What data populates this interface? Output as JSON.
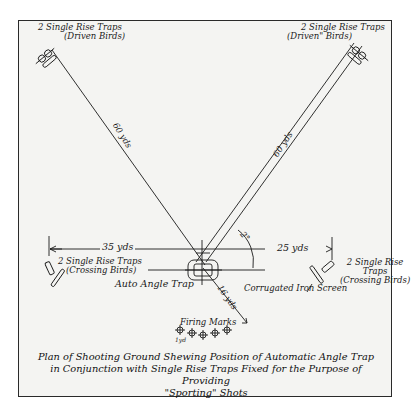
{
  "diagram": {
    "title": "Plan of Shooting Ground Shewing Position of Automatic Angle Trap in Conjunction with Single Rise Traps Fixed for the Purpose of Providing \"Sporting\" Shots",
    "caption_lines": [
      "Plan of Shooting Ground Shewing Position of Automatic Angle Trap",
      "in Conjunction with Single Rise Traps Fixed for the Purpose of Providing",
      "\"Sporting\" Shots"
    ],
    "traps": {
      "top_left": {
        "line1": "2 Single Rise Traps",
        "line2": "(Driven Birds)"
      },
      "top_right": {
        "line1": "2 Single Rise Traps",
        "line2": "(Driven\" Birds)"
      },
      "left": {
        "line1": "2 Single Rise Traps",
        "line2": "(Crossing Birds)"
      },
      "right": {
        "line1": "2 Single Rise",
        "line2": "Traps",
        "line3": "(Crossing Birds)"
      },
      "center": {
        "label": "Auto Angle Trap"
      }
    },
    "distances": {
      "left_diagonal": "60 yds",
      "right_diagonal": "60 yds",
      "left_horizontal": "35 yds",
      "right_horizontal": "25 yds",
      "to_firing_marks": "16 yds",
      "angle": "2°"
    },
    "labels": {
      "screen": "Corrugated Iron Screen",
      "firing_marks": "Firing Marks",
      "firing_marks_spacing": "1yd"
    },
    "colors": {
      "ink": "#1a1a1a",
      "paper": "#f4f4f2",
      "background": "#ffffff"
    }
  }
}
